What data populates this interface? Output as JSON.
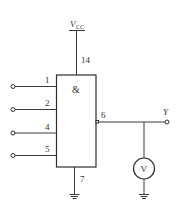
{
  "diagram": {
    "type": "circuit-schematic",
    "supply": {
      "label_main": "V",
      "label_sub": "CC",
      "pin": "14"
    },
    "gate": {
      "symbol": "&"
    },
    "inputs": [
      {
        "pin": "1"
      },
      {
        "pin": "2"
      },
      {
        "pin": "4"
      },
      {
        "pin": "5"
      }
    ],
    "output": {
      "pin": "6",
      "label": "Y"
    },
    "ground_pin": "7",
    "meter": {
      "symbol": "V"
    }
  }
}
